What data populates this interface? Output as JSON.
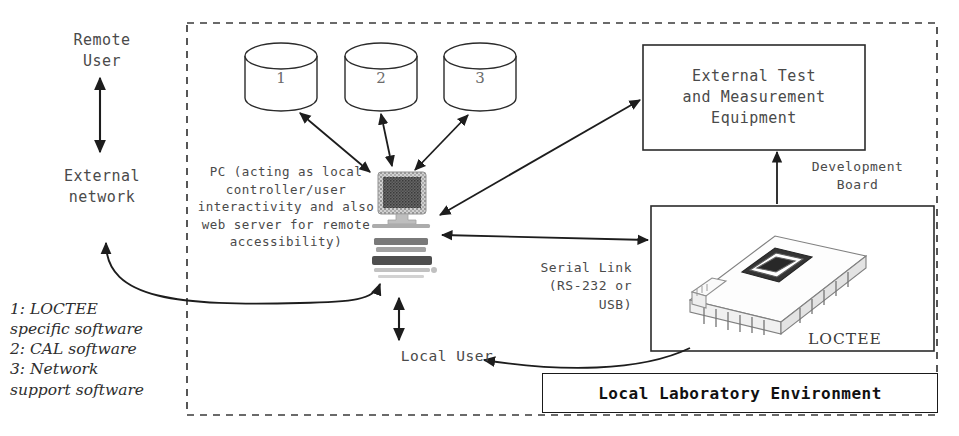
{
  "diagram": {
    "title_box": "Local Laboratory Environment",
    "external": {
      "remote_user": "Remote\nUser",
      "external_network": "External\nnetwork"
    },
    "legend": "1: LOCTEE\nspecific software\n2: CAL software\n3: Network\nsupport software",
    "databases": [
      {
        "label": "1",
        "name": "database-cylinder-1"
      },
      {
        "label": "2",
        "name": "database-cylinder-2"
      },
      {
        "label": "3",
        "name": "database-cylinder-3"
      }
    ],
    "pc": {
      "caption": "PC (acting as local controller/user interactivity and also web server for remote accessibility)",
      "art_name": "desktop-computer-illustration"
    },
    "local_user": "Local User",
    "serial_link": "Serial Link\n(RS-232 or\nUSB)",
    "development_board": "Development\nBoard",
    "external_test_equipment": {
      "line1": "External Test",
      "line2": "and Measurement",
      "line3": "Equipment"
    },
    "board": {
      "label": "LOCTEE",
      "art_name": "development-board-illustration"
    },
    "colors": {
      "stroke": "#2b2b2b",
      "text": "#4a4a4a",
      "bold_text": "#111111",
      "dashed_border": "#3a3a3a"
    }
  }
}
